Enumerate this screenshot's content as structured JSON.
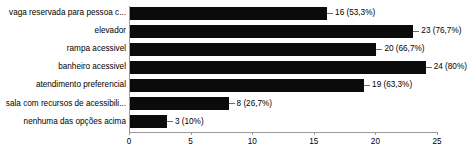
{
  "chart_data": {
    "type": "bar",
    "orientation": "horizontal",
    "title": "",
    "xlabel": "",
    "ylabel": "",
    "xlim": [
      0,
      25
    ],
    "xticks": [
      0,
      5,
      10,
      15,
      20,
      25
    ],
    "grid": false,
    "legend": false,
    "total_respondents": 30,
    "categories": [
      "vaga reservada para pessoa c...",
      "elevador",
      "rampa acessivel",
      "banheiro acessivel",
      "atendimento preferencial",
      "sala com recursos de acessibili...",
      "nenhuma das opções acima"
    ],
    "values": [
      16,
      23,
      20,
      24,
      19,
      8,
      3
    ],
    "data_labels": [
      "16 (53,3%)",
      "23 (76,7%)",
      "20 (66,7%)",
      "24 (80%)",
      "19 (63,3%)",
      "8 (26,7%)",
      "3 (10%)"
    ],
    "percentages": [
      53.3,
      76.7,
      66.7,
      80,
      63.3,
      26.7,
      10
    ],
    "bar_color": "#0b0b0b",
    "axis_color": "#9a9a9a"
  }
}
